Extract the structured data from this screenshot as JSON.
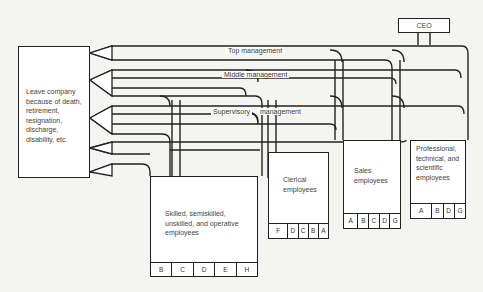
{
  "diagram": {
    "type": "employee flow diagram",
    "ceo": "CEO",
    "exit_box": {
      "lines": [
        "Leave company",
        "because of death,",
        "retirement,",
        "resignation,",
        "discharge,",
        "disability, etc."
      ]
    },
    "channels": [
      {
        "id": "top",
        "label": "Top management"
      },
      {
        "id": "middle",
        "label": "Middle management"
      },
      {
        "id": "supervisory_a",
        "label": "Supervisory"
      },
      {
        "id": "supervisory_b",
        "label": "management"
      }
    ],
    "groups": [
      {
        "name": "Skilled, semiskilled, unskilled, and operative employees",
        "lines": [
          "Skilled, semiskilled,",
          "unskilled, and operative",
          "employees"
        ],
        "codes": [
          "B",
          "C",
          "D",
          "E",
          "H"
        ]
      },
      {
        "name": "Clerical employees",
        "lines": [
          "Clerical",
          "employees"
        ],
        "codes": [
          "F",
          "D",
          "C",
          "B",
          "A"
        ]
      },
      {
        "name": "Sales employees",
        "lines": [
          "Sales",
          "employees"
        ],
        "codes": [
          "A",
          "B",
          "C",
          "D",
          "G"
        ]
      },
      {
        "name": "Professional, technical, and scientific employees",
        "lines": [
          "Professional,",
          "technical, and",
          "scientific",
          "employees"
        ],
        "codes": [
          "A",
          "B",
          "D",
          "G"
        ]
      }
    ],
    "colors": {
      "line": "#222222",
      "fill": "#ffffff",
      "background": "#f4f4f2",
      "channel_shade": "#e6e6e4"
    }
  }
}
